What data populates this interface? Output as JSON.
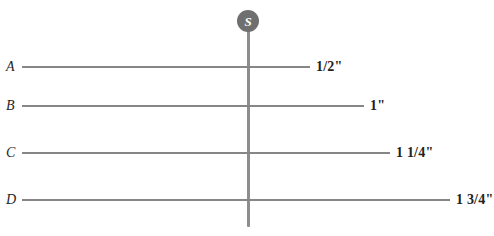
{
  "diagram": {
    "canvas": {
      "width": 494,
      "height": 236,
      "background": "#ffffff"
    },
    "pin": {
      "letter": "S",
      "icon_name": "screw-head-marker",
      "circle_color": "#6f6f6f",
      "letter_color": "#ffffff",
      "center_x": 248,
      "center_y": 21,
      "diameter": 22
    },
    "stem": {
      "color": "#8d8d8d",
      "x": 248,
      "top": 20,
      "bottom": 227,
      "thickness": 3
    },
    "rows": [
      {
        "letter": "A",
        "label": "1/2\"",
        "y": 67,
        "line_start": 22,
        "line_end": 310,
        "label_x": 316,
        "line_color": "#868686"
      },
      {
        "letter": "B",
        "label": "1\"",
        "y": 106,
        "line_start": 22,
        "line_end": 364,
        "label_x": 370,
        "line_color": "#868686"
      },
      {
        "letter": "C",
        "label": "1 1/4\"",
        "y": 153,
        "line_start": 22,
        "line_end": 390,
        "label_x": 396,
        "line_color": "#868686"
      },
      {
        "letter": "D",
        "label": "1 3/4\"",
        "y": 200,
        "line_start": 22,
        "line_end": 450,
        "label_x": 456,
        "line_color": "#868686"
      }
    ]
  }
}
